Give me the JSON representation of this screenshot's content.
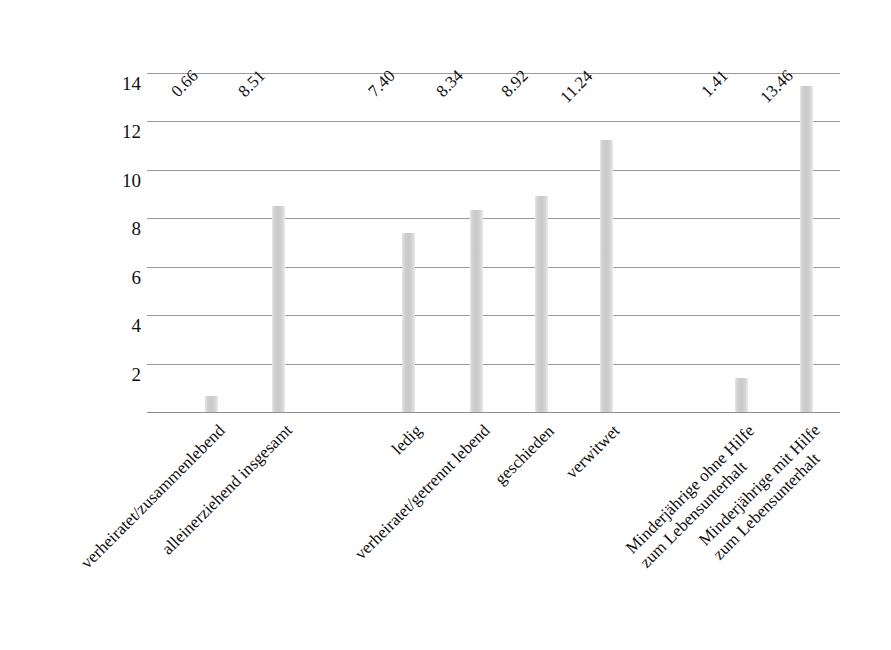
{
  "chart_data": {
    "type": "bar",
    "title": "",
    "subtitle": "",
    "xlabel": "",
    "ylabel": "",
    "ylim": [
      0,
      14
    ],
    "y_ticks": [
      2,
      4,
      6,
      8,
      10,
      12,
      14
    ],
    "grid": true,
    "legend": "none",
    "orientation": "vertical",
    "bar_color": "#cfcfcf",
    "gridline_color": "#9a9a9a",
    "categories": [
      "verheiratet/zusammenlebend",
      "alleinerziehend insgesamt",
      "ledig",
      "verheiratet/getrennt lebend",
      "geschieden",
      "verwitwet",
      "Minderjährige ohne Hilfe zum Lebensunterhalt",
      "Minderjährige mit Hilfe zum Lebensunterhalt"
    ],
    "category_lines": [
      [
        "verheiratet/zusammenlebend"
      ],
      [
        "alleinerziehend insgesamt"
      ],
      [
        "ledig"
      ],
      [
        "verheiratet/getrennt lebend"
      ],
      [
        "geschieden"
      ],
      [
        "verwitwet"
      ],
      [
        "Minderjährige ohne Hilfe",
        "zum Lebensunterhalt"
      ],
      [
        "Minderjährige mit Hilfe",
        "zum Lebensunterhalt"
      ]
    ],
    "values": [
      0.66,
      8.51,
      7.4,
      8.34,
      8.92,
      11.24,
      1.41,
      13.46
    ],
    "value_labels": [
      "0.66",
      "8.51",
      "7.40",
      "8.34",
      "8.92",
      "11.24",
      "1.41",
      "13.46"
    ]
  }
}
